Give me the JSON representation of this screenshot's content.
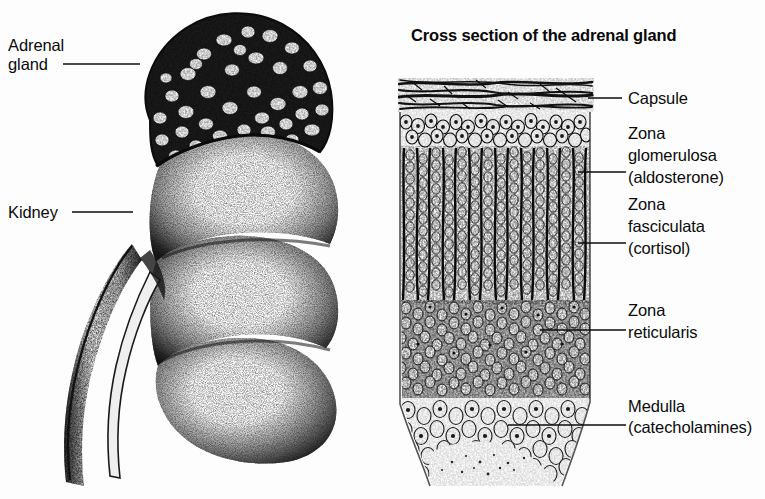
{
  "figure": {
    "kind": "anatomical-illustration",
    "style": "black and white stipple / line engraving"
  },
  "panels": {
    "left": {
      "name": "kidney-with-adrenal-gland",
      "labels": [
        {
          "id": "adrenal-gland",
          "line1": "Adrenal",
          "line2": "gland"
        },
        {
          "id": "kidney",
          "line1": "Kidney",
          "line2": ""
        }
      ]
    },
    "right": {
      "name": "adrenal-cross-section",
      "title": "Cross section of the adrenal gland",
      "labels": [
        {
          "id": "capsule",
          "line1": "Capsule",
          "line2": "",
          "line3": ""
        },
        {
          "id": "glomerulosa",
          "line1": "Zona",
          "line2": "glomerulosa",
          "line3": "(aldosterone)"
        },
        {
          "id": "fasciculata",
          "line1": "Zona",
          "line2": "fasciculata",
          "line3": "(cortisol)"
        },
        {
          "id": "reticularis",
          "line1": "Zona",
          "line2": "reticularis",
          "line3": ""
        },
        {
          "id": "medulla",
          "line1": "Medulla",
          "line2": "(catecholamines)",
          "line3": ""
        }
      ]
    }
  },
  "colors": {
    "ink": "#0d0d0d",
    "background": "#fdfdfd"
  }
}
